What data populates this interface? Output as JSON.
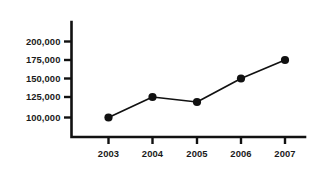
{
  "chart_data": {
    "type": "line",
    "title": "",
    "subtitle": "",
    "xlabel": "",
    "ylabel": "",
    "categories": [
      "2003",
      "2004",
      "2005",
      "2006",
      "2007"
    ],
    "values": [
      101000,
      126000,
      120000,
      150000,
      175000
    ],
    "series": [
      {
        "name": "",
        "values": [
          101000,
          126000,
          120000,
          150000,
          175000
        ]
      }
    ],
    "y_tick_labels": [
      "200,000",
      "175,000",
      "150,000",
      "125,000",
      "100,000"
    ],
    "y_tick_values": [
      200000,
      175000,
      150000,
      125000,
      100000
    ],
    "x_tick_labels": [
      "2003",
      "2004",
      "2005",
      "2006",
      "2007"
    ],
    "ylim": [
      87500,
      212500
    ],
    "xlim": [
      2002.4,
      2007.7
    ],
    "grid": false,
    "legend": false,
    "legend_position": "none",
    "marker": "circle",
    "line_color": "#111111",
    "marker_color": "#111111",
    "axis_color": "#111111",
    "background_color": "#ffffff",
    "annotations": []
  },
  "points": [
    {
      "label": "2003",
      "value": "101000",
      "cx": 108.5,
      "cy": 117.5
    },
    {
      "label": "2004",
      "value": "126000",
      "cx": 152.5,
      "cy": 97.0
    },
    {
      "label": "2005",
      "value": "120000",
      "cx": 197.0,
      "cy": 102.0
    },
    {
      "label": "2006",
      "value": "150000",
      "cx": 241.0,
      "cy": 78.5
    },
    {
      "label": "2007",
      "value": "175000",
      "cx": 285.0,
      "cy": 60.0
    }
  ],
  "y_ticks": [
    {
      "label": "200,000",
      "y": 41.5
    },
    {
      "label": "175,000",
      "y": 60.0
    },
    {
      "label": "150,000",
      "y": 78.5
    },
    {
      "label": "125,000",
      "y": 97.0
    },
    {
      "label": "100,000",
      "y": 117.5
    }
  ],
  "x_ticks": [
    {
      "label": "2003",
      "x": 108.5
    },
    {
      "label": "2004",
      "x": 152.5
    },
    {
      "label": "2005",
      "x": 197.0
    },
    {
      "label": "2006",
      "x": 241.0
    },
    {
      "label": "2007",
      "x": 285.0
    }
  ]
}
